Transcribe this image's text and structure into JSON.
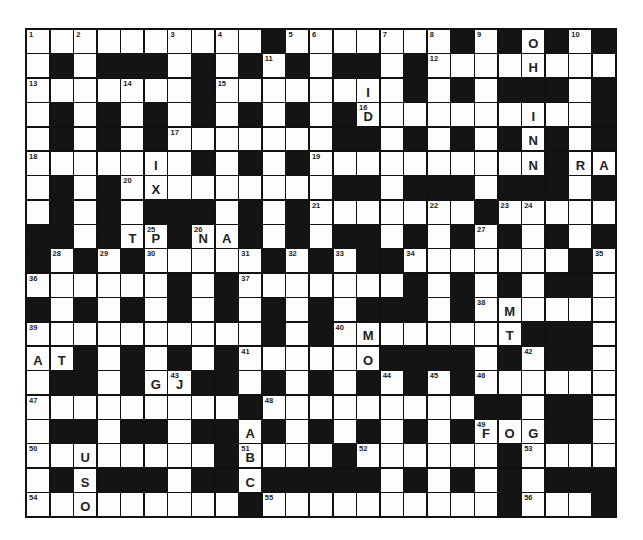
{
  "puzzle": {
    "type": "crossword",
    "cols": 25,
    "rows": 20,
    "legend": {
      "#": "black square",
      ".": "empty white square",
      "A-Z": "pre-filled letter"
    },
    "grid": [
      "..........#.......#.#.#.#",
      ".#.###.#.#.#.##.#.......",
      ".......#......I.#.#.###.#",
      ".#.#.#.#.#.#.#D.......I..#",
      ".#.#.#.......##.#.#.#N#.#",
      ".....I.#.#.#.........N#RA",
      ".#.#.X.......##.###.###.#",
      ".#.#.###.#.#.....#......",
      "##.#TP#NA#.#.##.#.#.#.#.#",
      "#.#.#....#.#.#..#......#.",
      "......#.#....#.#.#.#.##.",
      "#.#.#.#.#.#.#.#.###.#M....",
      ".........#.#.M......T###.",
      "AT#.#.#.#.....O####.#.##.",
      ".##.#GJ##.#.#.#.#.#.....",
      ".........#.........##.##.",
      ".##.##.##A#.#.#.#.#FOG##.",
      "...U....#B....#.......#....",
      ".#S###.##C###.#.#.#.#.###",
      "..O......#..........#...#"
    ],
    "cells": [
      [
        {
          "n": "1"
        },
        {},
        {
          "n": "2"
        },
        {},
        {},
        {},
        {
          "n": "3"
        },
        {},
        {
          "n": "4"
        },
        {},
        {
          "b": 1
        },
        {
          "n": "5"
        },
        {
          "n": "6"
        },
        {},
        {},
        {
          "n": "7"
        },
        {},
        {
          "n": "8"
        },
        {
          "b": 1
        },
        {
          "n": "9"
        },
        {
          "b": 1
        },
        {
          "l": "O"
        },
        {
          "b": 1
        },
        {
          "n": "10"
        },
        {
          "b": 1
        }
      ],
      [
        {},
        {
          "b": 1
        },
        {},
        {
          "b": 1
        },
        {
          "b": 1
        },
        {
          "b": 1
        },
        {},
        {
          "b": 1
        },
        {},
        {
          "b": 1
        },
        {
          "n": "11"
        },
        {
          "b": 1
        },
        {},
        {
          "b": 1
        },
        {
          "b": 1
        },
        {},
        {
          "b": 1
        },
        {
          "n": "12"
        },
        {},
        {},
        {},
        {
          "l": "H"
        },
        {},
        {},
        {}
      ],
      [
        {
          "n": "13"
        },
        {},
        {},
        {},
        {
          "n": "14"
        },
        {},
        {},
        {
          "b": 1
        },
        {
          "n": "15"
        },
        {},
        {},
        {},
        {},
        {},
        {
          "l": "I"
        },
        {},
        {
          "b": 1
        },
        {},
        {
          "b": 1
        },
        {},
        {
          "b": 1
        },
        {
          "b": 1
        },
        {
          "b": 1
        },
        {},
        {
          "b": 1
        }
      ],
      [
        {},
        {
          "b": 1
        },
        {},
        {
          "b": 1
        },
        {},
        {
          "b": 1
        },
        {},
        {
          "b": 1
        },
        {},
        {
          "b": 1
        },
        {},
        {
          "b": 1
        },
        {},
        {
          "b": 1
        },
        {
          "n": "16",
          "l": "D"
        },
        {},
        {},
        {},
        {},
        {},
        {},
        {
          "l": "I"
        },
        {},
        {},
        {
          "b": 1
        }
      ],
      [
        {},
        {
          "b": 1
        },
        {},
        {
          "b": 1
        },
        {},
        {
          "b": 1
        },
        {
          "n": "17"
        },
        {},
        {},
        {},
        {},
        {},
        {},
        {
          "b": 1
        },
        {
          "b": 1
        },
        {},
        {
          "b": 1
        },
        {},
        {
          "b": 1
        },
        {},
        {
          "b": 1
        },
        {
          "l": "N"
        },
        {
          "b": 1
        },
        {},
        {
          "b": 1
        }
      ],
      [
        {
          "n": "18"
        },
        {},
        {},
        {},
        {},
        {
          "l": "I"
        },
        {},
        {
          "b": 1
        },
        {},
        {
          "b": 1
        },
        {},
        {
          "b": 1
        },
        {
          "n": "19"
        },
        {},
        {},
        {},
        {},
        {},
        {},
        {},
        {},
        {
          "l": "N"
        },
        {
          "b": 1
        },
        {
          "l": "R"
        },
        {
          "l": "A"
        }
      ],
      [
        {},
        {
          "b": 1
        },
        {},
        {
          "b": 1
        },
        {
          "n": "20"
        },
        {
          "l": "X"
        },
        {},
        {},
        {},
        {},
        {},
        {},
        {},
        {
          "b": 1
        },
        {
          "b": 1
        },
        {},
        {
          "b": 1
        },
        {
          "b": 1
        },
        {
          "b": 1
        },
        {},
        {
          "b": 1
        },
        {
          "b": 1
        },
        {
          "b": 1
        },
        {},
        {
          "b": 1
        }
      ],
      [
        {},
        {
          "b": 1
        },
        {},
        {
          "b": 1
        },
        {},
        {
          "b": 1
        },
        {
          "b": 1
        },
        {
          "b": 1
        },
        {},
        {
          "b": 1
        },
        {},
        {
          "b": 1
        },
        {
          "n": "21"
        },
        {},
        {},
        {},
        {},
        {
          "n": "22"
        },
        {},
        {
          "b": 1
        },
        {
          "n": "23"
        },
        {
          "n": "24"
        },
        {},
        {},
        {}
      ],
      [
        {
          "b": 1
        },
        {
          "b": 1
        },
        {},
        {
          "b": 1
        },
        {
          "l": "T"
        },
        {
          "n": "25",
          "l": "P"
        },
        {
          "b": 1
        },
        {
          "n": "26",
          "l": "N"
        },
        {
          "l": "A"
        },
        {
          "b": 1
        },
        {},
        {
          "b": 1
        },
        {},
        {
          "b": 1
        },
        {
          "b": 1
        },
        {},
        {
          "b": 1
        },
        {},
        {
          "b": 1
        },
        {
          "n": "27"
        },
        {
          "b": 1
        },
        {},
        {
          "b": 1
        },
        {},
        {
          "b": 1
        }
      ],
      [
        {
          "b": 1
        },
        {
          "n": "28"
        },
        {
          "b": 1
        },
        {
          "n": "29"
        },
        {
          "b": 1
        },
        {
          "n": "30"
        },
        {},
        {},
        {},
        {
          "n": "31"
        },
        {
          "b": 1
        },
        {
          "n": "32"
        },
        {
          "b": 1
        },
        {
          "n": "33"
        },
        {
          "b": 1
        },
        {
          "b": 1
        },
        {
          "n": "34"
        },
        {},
        {},
        {},
        {},
        {},
        {},
        {
          "b": 1
        },
        {
          "n": "35"
        }
      ],
      [
        {
          "n": "36"
        },
        {},
        {},
        {},
        {},
        {},
        {
          "b": 1
        },
        {},
        {
          "b": 1
        },
        {
          "n": "37"
        },
        {},
        {},
        {},
        {},
        {},
        {},
        {
          "b": 1
        },
        {},
        {
          "b": 1
        },
        {},
        {
          "b": 1
        },
        {},
        {
          "b": 1
        },
        {
          "b": 1
        },
        {}
      ],
      [
        {
          "b": 1
        },
        {},
        {
          "b": 1
        },
        {},
        {
          "b": 1
        },
        {},
        {
          "b": 1
        },
        {},
        {
          "b": 1
        },
        {},
        {
          "b": 1
        },
        {},
        {
          "b": 1
        },
        {},
        {
          "b": 1
        },
        {
          "b": 1
        },
        {
          "b": 1
        },
        {},
        {
          "b": 1
        },
        {
          "n": "38"
        },
        {
          "l": "M"
        },
        {},
        {},
        {},
        {}
      ],
      [
        {
          "n": "39"
        },
        {},
        {},
        {},
        {},
        {},
        {},
        {},
        {},
        {},
        {
          "b": 1
        },
        {},
        {
          "b": 1
        },
        {
          "n": "40"
        },
        {
          "l": "M"
        },
        {},
        {},
        {},
        {},
        {},
        {
          "l": "T"
        },
        {
          "b": 1
        },
        {
          "b": 1
        },
        {
          "b": 1
        },
        {}
      ],
      [
        {
          "l": "A"
        },
        {
          "l": "T"
        },
        {
          "b": 1
        },
        {},
        {
          "b": 1
        },
        {},
        {
          "b": 1
        },
        {},
        {
          "b": 1
        },
        {
          "n": "41"
        },
        {},
        {},
        {},
        {},
        {
          "l": "O"
        },
        {
          "b": 1
        },
        {
          "b": 1
        },
        {
          "b": 1
        },
        {
          "b": 1
        },
        {},
        {
          "b": 1
        },
        {
          "n": "42"
        },
        {
          "b": 1
        },
        {
          "b": 1
        },
        {}
      ],
      [
        {},
        {
          "b": 1
        },
        {
          "b": 1
        },
        {},
        {
          "b": 1
        },
        {
          "l": "G"
        },
        {
          "n": "43",
          "l": "J"
        },
        {
          "b": 1
        },
        {
          "b": 1
        },
        {},
        {
          "b": 1
        },
        {},
        {
          "b": 1
        },
        {},
        {
          "b": 1
        },
        {
          "n": "44"
        },
        {
          "b": 1
        },
        {
          "n": "45"
        },
        {
          "b": 1
        },
        {
          "n": "46"
        },
        {},
        {},
        {},
        {},
        {}
      ],
      [
        {
          "n": "47"
        },
        {},
        {},
        {},
        {},
        {},
        {},
        {},
        {},
        {
          "b": 1
        },
        {
          "n": "48"
        },
        {},
        {},
        {},
        {},
        {},
        {},
        {},
        {},
        {
          "b": 1
        },
        {
          "b": 1
        },
        {},
        {
          "b": 1
        },
        {
          "b": 1
        },
        {}
      ],
      [
        {},
        {
          "b": 1
        },
        {
          "b": 1
        },
        {},
        {
          "b": 1
        },
        {
          "b": 1
        },
        {},
        {
          "b": 1
        },
        {
          "b": 1
        },
        {
          "l": "A"
        },
        {
          "b": 1
        },
        {},
        {
          "b": 1
        },
        {},
        {
          "b": 1
        },
        {},
        {
          "b": 1
        },
        {},
        {
          "b": 1
        },
        {
          "n": "49",
          "l": "F"
        },
        {
          "l": "O"
        },
        {
          "l": "G"
        },
        {
          "b": 1
        },
        {
          "b": 1
        },
        {}
      ],
      [
        {
          "n": "50"
        },
        {},
        {
          "l": "U"
        },
        {},
        {},
        {},
        {},
        {},
        {
          "b": 1
        },
        {
          "n": "51",
          "l": "B"
        },
        {},
        {},
        {},
        {
          "b": 1
        },
        {
          "n": "52"
        },
        {},
        {},
        {},
        {},
        {},
        {
          "b": 1
        },
        {
          "n": "53"
        },
        {},
        {},
        {}
      ],
      [
        {},
        {
          "b": 1
        },
        {
          "l": "S"
        },
        {
          "b": 1
        },
        {
          "b": 1
        },
        {
          "b": 1
        },
        {},
        {
          "b": 1
        },
        {
          "b": 1
        },
        {
          "l": "C"
        },
        {
          "b": 1
        },
        {
          "b": 1
        },
        {
          "b": 1
        },
        {
          "b": 1
        },
        {
          "b": 1
        },
        {},
        {
          "b": 1
        },
        {},
        {
          "b": 1
        },
        {},
        {
          "b": 1
        },
        {},
        {
          "b": 1
        },
        {
          "b": 1
        },
        {
          "b": 1
        }
      ],
      [
        {
          "n": "54"
        },
        {},
        {
          "l": "O"
        },
        {},
        {},
        {},
        {},
        {},
        {},
        {
          "b": 1
        },
        {
          "n": "55"
        },
        {},
        {},
        {},
        {},
        {},
        {},
        {},
        {},
        {},
        {
          "b": 1
        },
        {
          "n": "56"
        },
        {},
        {},
        {
          "b": 1
        }
      ]
    ],
    "prefilled_letters": [
      "O",
      "H",
      "I",
      "D",
      "I",
      "N",
      "I",
      "N",
      "R",
      "A",
      "X",
      "T",
      "P",
      "N",
      "A",
      "M",
      "M",
      "T",
      "A",
      "T",
      "O",
      "G",
      "J",
      "A",
      "F",
      "O",
      "G",
      "U",
      "B",
      "S",
      "C",
      "O"
    ],
    "colors": {
      "block": "#141414",
      "cell": "#fdfdfd",
      "ink": "#222222"
    }
  }
}
